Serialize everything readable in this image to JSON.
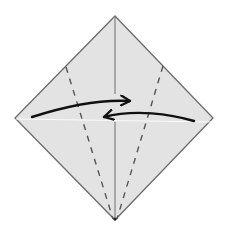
{
  "diagram": {
    "type": "origami-step",
    "colors": {
      "background": "#ffffff",
      "paper_fill": "#e3e3e3",
      "paper_edge": "#6b6b6b",
      "center_crease": "#7a7a7a",
      "valley_fold_dashes": "#555555",
      "arrow": "#111111",
      "horizontal_highlight": "#f7f7f7"
    },
    "paper": {
      "shape": "square-diamond",
      "vertices": {
        "top": [
          115,
          16
        ],
        "right": [
          213,
          118
        ],
        "bottom": [
          115,
          220
        ],
        "left": [
          15,
          118
        ]
      }
    },
    "creases": [
      {
        "name": "vertical-center-crease",
        "style": "solid",
        "from": [
          115,
          16
        ],
        "to": [
          115,
          220
        ]
      },
      {
        "name": "horizontal-crease",
        "style": "faint-white",
        "from": [
          15,
          119
        ],
        "to": [
          213,
          121
        ]
      }
    ],
    "fold_lines": [
      {
        "name": "left-valley-fold",
        "style": "dashed",
        "from": [
          66,
          67
        ],
        "to": [
          113,
          220
        ]
      },
      {
        "name": "right-valley-fold",
        "style": "dashed",
        "from": [
          163,
          66
        ],
        "to": [
          117,
          220
        ]
      }
    ],
    "arrows": [
      {
        "name": "left-flap-arrow",
        "direction": "right",
        "from": [
          32,
          117
        ],
        "to": [
          131,
          100
        ]
      },
      {
        "name": "right-flap-arrow",
        "direction": "left",
        "from": [
          194,
          121
        ],
        "to": [
          103,
          117
        ]
      }
    ]
  }
}
